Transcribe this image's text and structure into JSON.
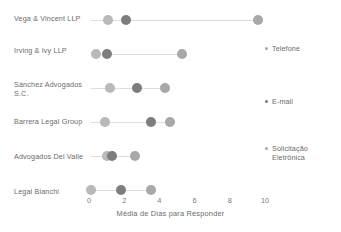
{
  "chart_data": {
    "type": "scatter",
    "title": "",
    "xlabel": "Média de Dias para Responder",
    "ylabel": "",
    "xlim": [
      0,
      10
    ],
    "xticks": [
      0,
      2,
      4,
      6,
      8,
      10
    ],
    "xtick_labels": [
      "0",
      "2",
      "4",
      "6",
      "8",
      "10"
    ],
    "grid": false,
    "legend_position": "right",
    "categories": [
      "Vega & Vincent LLP",
      "Irving & Ivy LLP",
      "Sánchez Advogados S.C.",
      "Barrera Legal Group",
      "Advogados Del Valle",
      "Legal Bianchi"
    ],
    "series": [
      {
        "name": "Telefone",
        "color": "#b9b9b9",
        "values": [
          1.1,
          0.4,
          1.2,
          0.9,
          1.0,
          0.1
        ]
      },
      {
        "name": "E-mail",
        "color": "#7d7d7d",
        "values": [
          2.1,
          1.0,
          2.7,
          3.5,
          1.3,
          1.8
        ]
      },
      {
        "name": "Solicitação Eletrônica",
        "color": "#a8a8a8",
        "values": [
          9.6,
          5.3,
          4.3,
          4.6,
          2.6,
          3.5
        ]
      }
    ],
    "connector_color": "#dedede",
    "axis_text_color": "#6b6b6b"
  },
  "legend": {
    "items": [
      {
        "label": "Telefone",
        "color": "#a8a8a8"
      },
      {
        "label": "E-mail",
        "color": "#7d7d7d"
      },
      {
        "label": "Solicitação Eletrônica",
        "color": "#a8a8a8"
      }
    ]
  }
}
